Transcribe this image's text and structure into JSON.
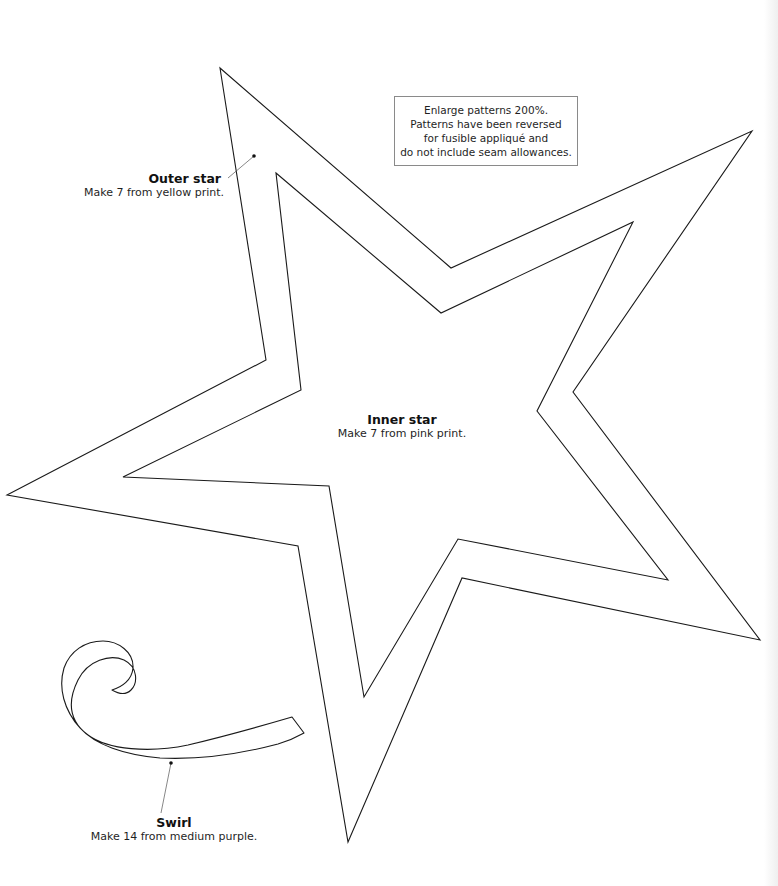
{
  "note": {
    "lines": [
      "Enlarge patterns 200%.",
      "Patterns have been reversed",
      "for fusible appliqué and",
      "do not include seam allowances."
    ]
  },
  "pieces": {
    "outer_star": {
      "title": "Outer star",
      "instruction": "Make 7 from yellow print."
    },
    "inner_star": {
      "title": "Inner star",
      "instruction": "Make 7 from pink print."
    },
    "swirl": {
      "title": "Swirl",
      "instruction": "Make 14 from medium purple."
    }
  },
  "shapes": {
    "outer_star_points": "220,68 451,268 752,131 573,392 760,640 462,578 348,842 298,546 7,495 266,360",
    "inner_star_points": "276,173 441,313 633,222 537,411 668,580 458,539 364,697 329,486 123,477 301,390",
    "swirl_path": "M 292,717 C 258,727 230,735 188,745 C 150,753 108,750 88,735 C 68,720 68,700 78,680 C 88,660 110,654 124,660 C 138,667 138,683 131,690 C 125,696 117,693 112,690 C 122,687 132,680 133,668 C 134,652 118,641 103,641 C 85,641 70,651 64,668 C 58,688 64,710 80,728 C 95,745 125,755 160,758 C 200,760 240,754 278,744 C 288,741 297,737 304,733 Z"
  },
  "colors": {
    "stroke": "#1a1a1a",
    "leader": "#555555",
    "box_border": "#8a8a8a"
  }
}
